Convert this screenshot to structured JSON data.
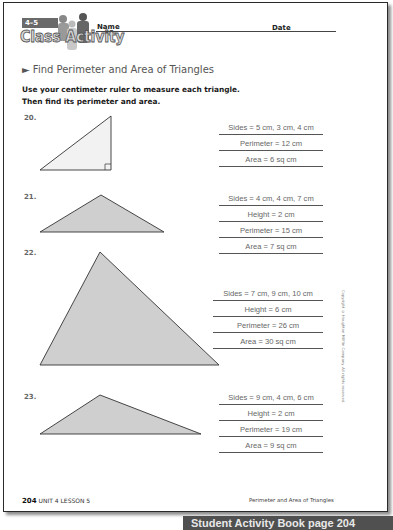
{
  "header": {
    "lesson_number": "4–5",
    "activity_title": "Class Activity",
    "name_label": "Name",
    "date_label": "Date"
  },
  "section": {
    "title": "► Find Perimeter and Area of Triangles",
    "instructions_line1": "Use your centimeter ruler to measure each triangle.",
    "instructions_line2": "Then find its perimeter and area."
  },
  "problems": [
    {
      "number": "20.",
      "answers": [
        "Sides = 5 cm, 3 cm, 4 cm",
        "Perimeter = 12 cm",
        "Area = 6 sq cm"
      ]
    },
    {
      "number": "21.",
      "answers": [
        "Sides = 4 cm, 4 cm, 7 cm",
        "Height = 2 cm",
        "Perimeter = 15 cm",
        "Area = 7 sq cm"
      ]
    },
    {
      "number": "22.",
      "answers": [
        "Sides = 7 cm, 9 cm, 10 cm",
        "Height = 6 cm",
        "Perimeter = 26 cm",
        "Area = 30 sq cm"
      ]
    },
    {
      "number": "23.",
      "answers": [
        "Sides = 9 cm, 4 cm, 6 cm",
        "Height = 2 cm",
        "Perimeter = 19 cm",
        "Area = 9 sq cm"
      ]
    }
  ],
  "copyright": "Copyright © Houghton Mifflin Company. All rights reserved.",
  "footer": {
    "page_number": "204",
    "unit_lesson": "UNIT 4 LESSON 5",
    "topic": "Perimeter and Area of Triangles"
  },
  "banner": {
    "label": "Student Activity Book page 204"
  },
  "colors": {
    "triangle_fill": "#cfcfcf",
    "triangle_fill_light": "#efefef",
    "banner_bg": "#505050",
    "answer_text": "#666666"
  }
}
